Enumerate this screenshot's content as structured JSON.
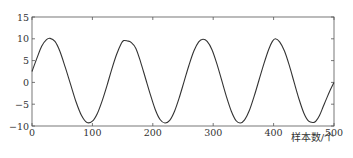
{
  "chart_data": {
    "type": "line",
    "title": "",
    "xlabel": "样本数/个",
    "ylabel": "",
    "xlim": [
      0,
      500
    ],
    "ylim": [
      -10,
      15
    ],
    "xticks": [
      0,
      100,
      200,
      300,
      400,
      500
    ],
    "yticks": [
      -10,
      -5,
      0,
      5,
      10,
      15
    ],
    "grid": false,
    "legend": null,
    "line_color": "#333333",
    "series": [
      {
        "name": "signal",
        "x": [
          0,
          8,
          16,
          24,
          30,
          38,
          46,
          55,
          64,
          73,
          82,
          91,
          100,
          108,
          116,
          124,
          132,
          140,
          148,
          152,
          158,
          164,
          172,
          180,
          188,
          196,
          204,
          212,
          220,
          228,
          236,
          244,
          252,
          260,
          268,
          276,
          283,
          290,
          298,
          306,
          314,
          322,
          330,
          338,
          345,
          352,
          360,
          368,
          376,
          384,
          392,
          398,
          403,
          410,
          418,
          426,
          434,
          442,
          450,
          458,
          466,
          470,
          476,
          482,
          488,
          494,
          500
        ],
        "y": [
          2.5,
          5.5,
          8.3,
          9.8,
          10.1,
          9.4,
          7.2,
          3.5,
          -0.5,
          -4.5,
          -7.6,
          -9.2,
          -8.9,
          -7.2,
          -4.3,
          -0.8,
          3.0,
          6.4,
          9.0,
          9.6,
          9.5,
          9.2,
          7.8,
          4.6,
          0.9,
          -2.8,
          -6.2,
          -8.5,
          -9.3,
          -8.7,
          -6.6,
          -3.4,
          0.3,
          4.0,
          7.2,
          9.3,
          9.9,
          9.4,
          7.5,
          4.3,
          0.5,
          -3.3,
          -6.6,
          -8.8,
          -9.3,
          -8.6,
          -6.4,
          -3.1,
          0.6,
          4.3,
          7.6,
          9.4,
          10.0,
          9.3,
          7.2,
          3.9,
          0.0,
          -3.8,
          -7.0,
          -8.9,
          -9.2,
          -8.9,
          -7.6,
          -5.6,
          -3.6,
          -1.7,
          0.0
        ]
      }
    ]
  }
}
